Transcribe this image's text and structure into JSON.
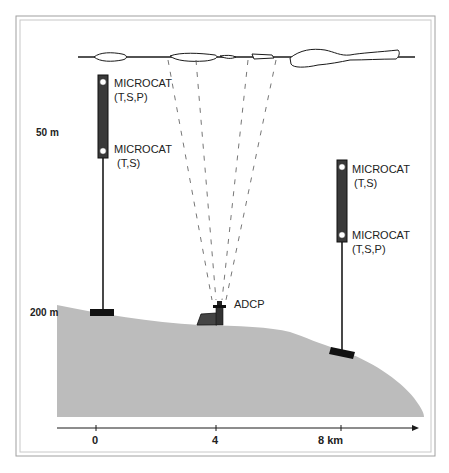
{
  "colors": {
    "frame": "#9a9a9a",
    "seafloor": "#bdbdbd",
    "ink": "#1a1a1a",
    "instrument_body": "#3a3a3a",
    "beam": "#777777"
  },
  "depth_labels": {
    "d50": "50 m",
    "d200": "200 m"
  },
  "left_mooring": {
    "upper_label_line1": "MICROCAT",
    "upper_label_line2": "(T,S,P)",
    "lower_label_line1": "MICROCAT",
    "lower_label_line2": "(T,S)"
  },
  "right_mooring": {
    "upper_label_line1": "MICROCAT",
    "upper_label_line2": "(T,S)",
    "lower_label_line1": "MICROCAT",
    "lower_label_line2": "(T,S,P)"
  },
  "adcp": {
    "label": "ADCP"
  },
  "x_axis": {
    "ticks": [
      {
        "label": "0"
      },
      {
        "label": "4"
      },
      {
        "label": "8 km"
      }
    ]
  }
}
